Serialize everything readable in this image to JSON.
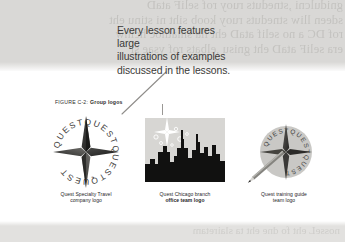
{
  "background": {
    "ghost_text": "gnidulcni ,stneduts ruoy rof seliF ataD\nsdeen lliw stneduts ruoy koob siht ni stinu eht\nrof DC a no selif ataD eht lla sniatnoc hcihw\nera seliF ataD eht gnisu ,elbats rof ysae si",
    "bottom_ghost_text": "nosseL eht fo dne eht ta slairetam",
    "band_color": "#d9d8d6",
    "text_color": "#c3c2bf"
  },
  "callout": {
    "text": "Every lesson features large\nillustrations of examples\ndiscussed in the lessons.",
    "text_color": "#3b3a38",
    "leader_color": "#8f8d8a"
  },
  "figure": {
    "number_label": "FIGURE C-2:",
    "title": "Group logos",
    "caption_color": "#2f2e2c",
    "logos": [
      {
        "name": "quest-specialty-travel-logo",
        "art": "compass-star-with-circular-quest-text",
        "caption_line1": "Quest Specialty Travel",
        "caption_line2": "company logo",
        "caption_line1_bold": false,
        "caption_line2_bold": false,
        "circular_text": "QUEST"
      },
      {
        "name": "quest-chicago-branch-logo",
        "art": "chicago-skyline-silhouette-with-star",
        "caption_line1": "Quest Chicago branch",
        "caption_line2": "office team logo",
        "caption_line1_bold": false,
        "caption_line2_bold": true,
        "circular_text": ""
      },
      {
        "name": "quest-training-guide-team-logo",
        "art": "circle-compass-with-pencil",
        "caption_line1": "Quest training guide",
        "caption_line2": "team logo",
        "caption_line1_bold": false,
        "caption_line2_bold": false,
        "circular_text": "QUEST"
      }
    ]
  }
}
